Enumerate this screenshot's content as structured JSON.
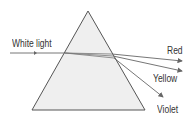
{
  "diagram": {
    "labels": {
      "incident": "White light",
      "red": "Red",
      "yellow": "Yellow",
      "violet": "Violet"
    },
    "colors": {
      "prism_fill": "#efefef",
      "prism_stroke": "#555555",
      "ray": "#666666",
      "text": "#333333"
    }
  }
}
